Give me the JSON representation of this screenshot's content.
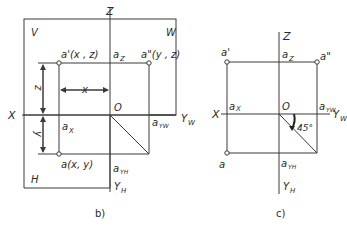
{
  "figure_b": {
    "caption": "b)",
    "planes": {
      "V": "V",
      "W": "W",
      "H": "H"
    },
    "axes": {
      "X": "X",
      "Z": "Z",
      "Y_W": "Y",
      "Y_W_sub": "W",
      "Y_H": "Y",
      "Y_H_sub": "H",
      "origin": "O"
    },
    "points": {
      "a_prime": "a'(x , z)",
      "a_double_prime": "a\"(y , z)",
      "a": "a(x, y)",
      "a_z": "a",
      "a_z_sub": "Z",
      "a_x": "a",
      "a_x_sub": "X",
      "a_YW": "a",
      "a_YW_sub": "YW",
      "a_YH": "a",
      "a_YH_sub": "YH"
    },
    "dimensions": {
      "x": "x",
      "z": "z",
      "y": "y"
    }
  },
  "figure_c": {
    "caption": "c)",
    "axes": {
      "X": "X",
      "Z": "Z",
      "Y_W": "Y",
      "Y_W_sub": "W",
      "Y_H": "Y",
      "Y_H_sub": "H",
      "origin": "O"
    },
    "points": {
      "a_prime": "a'",
      "a_double_prime": "a\"",
      "a": "a",
      "a_z": "a",
      "a_z_sub": "Z",
      "a_x": "a",
      "a_x_sub": "X",
      "a_YW": "a",
      "a_YW_sub": "YW",
      "a_YH": "a",
      "a_YH_sub": "YH"
    },
    "angle": "45°"
  }
}
